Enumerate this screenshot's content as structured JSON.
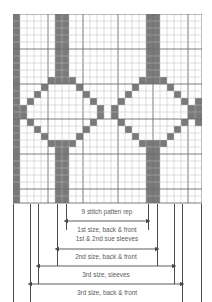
{
  "chart_data": {
    "type": "heatmap",
    "grid": {
      "columns": 27,
      "rows": 27,
      "cell_px": 7,
      "filled_color": "#7a7a7a",
      "empty_color": "#ffffff",
      "line_color": "#b9b9b9",
      "heavy_line_color": "#6e6e6e",
      "heavy_line_every": 5,
      "legend": [
        {
          "swatch": "#7a7a7a",
          "label": "pattern stitch"
        },
        {
          "swatch": "#ffffff",
          "label": "background stitch"
        }
      ],
      "filled_cells": [
        [
          0,
          0
        ],
        [
          0,
          6
        ],
        [
          0,
          7
        ],
        [
          0,
          19
        ],
        [
          0,
          20
        ],
        [
          1,
          0
        ],
        [
          1,
          6
        ],
        [
          1,
          7
        ],
        [
          1,
          19
        ],
        [
          1,
          20
        ],
        [
          2,
          0
        ],
        [
          2,
          6
        ],
        [
          2,
          7
        ],
        [
          2,
          19
        ],
        [
          2,
          20
        ],
        [
          3,
          0
        ],
        [
          3,
          6
        ],
        [
          3,
          7
        ],
        [
          3,
          19
        ],
        [
          3,
          20
        ],
        [
          4,
          0
        ],
        [
          4,
          6
        ],
        [
          4,
          7
        ],
        [
          4,
          19
        ],
        [
          4,
          20
        ],
        [
          5,
          0
        ],
        [
          5,
          6
        ],
        [
          5,
          7
        ],
        [
          5,
          19
        ],
        [
          5,
          20
        ],
        [
          6,
          0
        ],
        [
          6,
          6
        ],
        [
          6,
          7
        ],
        [
          6,
          19
        ],
        [
          6,
          20
        ],
        [
          7,
          0
        ],
        [
          7,
          6
        ],
        [
          7,
          7
        ],
        [
          7,
          19
        ],
        [
          7,
          20
        ],
        [
          8,
          0
        ],
        [
          8,
          6
        ],
        [
          8,
          7
        ],
        [
          8,
          19
        ],
        [
          8,
          20
        ],
        [
          9,
          0
        ],
        [
          9,
          5
        ],
        [
          9,
          6
        ],
        [
          9,
          7
        ],
        [
          9,
          8
        ],
        [
          9,
          18
        ],
        [
          9,
          19
        ],
        [
          9,
          20
        ],
        [
          9,
          21
        ],
        [
          10,
          0
        ],
        [
          10,
          4
        ],
        [
          10,
          9
        ],
        [
          10,
          17
        ],
        [
          10,
          22
        ],
        [
          11,
          0
        ],
        [
          11,
          3
        ],
        [
          11,
          10
        ],
        [
          11,
          16
        ],
        [
          11,
          23
        ],
        [
          12,
          0
        ],
        [
          12,
          2
        ],
        [
          12,
          11
        ],
        [
          12,
          15
        ],
        [
          12,
          24
        ],
        [
          12,
          26
        ],
        [
          13,
          0
        ],
        [
          13,
          1
        ],
        [
          13,
          12
        ],
        [
          13,
          14
        ],
        [
          13,
          25
        ],
        [
          13,
          26
        ],
        [
          14,
          0
        ],
        [
          14,
          1
        ],
        [
          14,
          12
        ],
        [
          14,
          14
        ],
        [
          14,
          25
        ],
        [
          14,
          26
        ],
        [
          15,
          0
        ],
        [
          15,
          2
        ],
        [
          15,
          11
        ],
        [
          15,
          15
        ],
        [
          15,
          24
        ],
        [
          15,
          26
        ],
        [
          16,
          0
        ],
        [
          16,
          3
        ],
        [
          16,
          10
        ],
        [
          16,
          16
        ],
        [
          16,
          23
        ],
        [
          17,
          0
        ],
        [
          17,
          4
        ],
        [
          17,
          9
        ],
        [
          17,
          17
        ],
        [
          17,
          22
        ],
        [
          18,
          0
        ],
        [
          18,
          5
        ],
        [
          18,
          6
        ],
        [
          18,
          7
        ],
        [
          18,
          8
        ],
        [
          18,
          18
        ],
        [
          18,
          19
        ],
        [
          18,
          20
        ],
        [
          18,
          21
        ],
        [
          19,
          0
        ],
        [
          19,
          6
        ],
        [
          19,
          7
        ],
        [
          19,
          19
        ],
        [
          19,
          20
        ],
        [
          20,
          0
        ],
        [
          20,
          6
        ],
        [
          20,
          7
        ],
        [
          20,
          19
        ],
        [
          20,
          20
        ],
        [
          21,
          0
        ],
        [
          21,
          6
        ],
        [
          21,
          7
        ],
        [
          21,
          19
        ],
        [
          21,
          20
        ],
        [
          22,
          0
        ],
        [
          22,
          6
        ],
        [
          22,
          7
        ],
        [
          22,
          19
        ],
        [
          22,
          20
        ],
        [
          23,
          0
        ],
        [
          23,
          6
        ],
        [
          23,
          7
        ],
        [
          23,
          19
        ],
        [
          23,
          20
        ],
        [
          24,
          0
        ],
        [
          24,
          6
        ],
        [
          24,
          7
        ],
        [
          24,
          19
        ],
        [
          24,
          20
        ],
        [
          25,
          0
        ],
        [
          25,
          6
        ],
        [
          25,
          7
        ],
        [
          25,
          19
        ],
        [
          25,
          20
        ],
        [
          26,
          0
        ],
        [
          26,
          6
        ],
        [
          26,
          7
        ],
        [
          26,
          19
        ],
        [
          26,
          20
        ]
      ]
    },
    "measurements": {
      "tick_marks": [
        13,
        30,
        38,
        57,
        66,
        148,
        157,
        174,
        182,
        201
      ],
      "rows": [
        {
          "label": "9 stitch patten rep",
          "start_px": 66,
          "end_px": 148,
          "label_y": 214,
          "arrow_y": 221,
          "label_above": true
        },
        {
          "label": "1st size, back & front",
          "start_px": 57,
          "end_px": 157,
          "label_y": 232,
          "arrow_y": 249,
          "label_above": true
        },
        {
          "label": "1st & 2nd sue sleeves",
          "start_px": 57,
          "end_px": 157,
          "label_y": 241,
          "arrow_y": 249,
          "label_above": true
        },
        {
          "label": "2nd size, back & front",
          "start_px": 38,
          "end_px": 174,
          "label_y": 259,
          "arrow_y": 266,
          "label_above": true
        },
        {
          "label": "3rd size, sleeves",
          "start_px": 30,
          "end_px": 182,
          "label_y": 277,
          "arrow_y": 284,
          "label_above": true
        },
        {
          "label": "3rd size, back & front",
          "start_px": 13,
          "end_px": 201,
          "label_y": 295,
          "arrow_y": 302,
          "label_above": true
        }
      ]
    }
  }
}
